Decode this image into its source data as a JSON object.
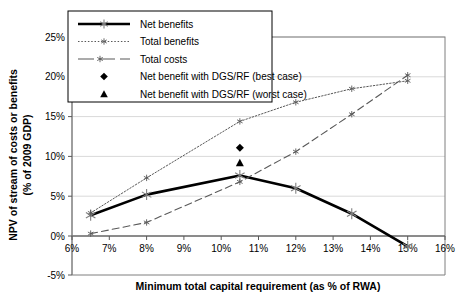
{
  "chart_data": {
    "type": "line",
    "title": "",
    "xlabel": "Minimum total capital requirement (as % of RWA)",
    "ylabel": "NPV of stream of costs or benefits (% of 2009 GDP)",
    "ylabel_line1": "NPV of stream of costs or benefits",
    "ylabel_line2": "(% of 2009 GDP)",
    "xlim": [
      6,
      16
    ],
    "ylim": [
      -5,
      25
    ],
    "xticks": [
      6,
      7,
      8,
      9,
      10,
      11,
      12,
      13,
      14,
      15,
      16
    ],
    "xtick_labels": [
      "6%",
      "7%",
      "8%",
      "9%",
      "10%",
      "11%",
      "12%",
      "13%",
      "14%",
      "15%",
      "16%"
    ],
    "yticks": [
      -5,
      0,
      5,
      10,
      15,
      20,
      25
    ],
    "ytick_labels": [
      "-5%",
      "0%",
      "5%",
      "10%",
      "15%",
      "20%",
      "25%"
    ],
    "grid": "horizontal",
    "legend_position": "top-left",
    "x": [
      6.5,
      8,
      10.5,
      12,
      13.5,
      15
    ],
    "series": [
      {
        "name": "Net benefits",
        "style": "solid-thick",
        "color": "#000000",
        "values": [
          2.6,
          5.2,
          7.6,
          6.0,
          2.8,
          -1.3
        ]
      },
      {
        "name": "Total benefits",
        "style": "dotted",
        "color": "#595959",
        "values": [
          2.9,
          7.3,
          14.4,
          16.8,
          18.5,
          19.5
        ]
      },
      {
        "name": "Total costs",
        "style": "dashed",
        "color": "#595959",
        "values": [
          0.3,
          1.7,
          6.8,
          10.6,
          15.3,
          20.2
        ]
      }
    ],
    "point_markers": [
      {
        "name": "Net benefit with DGS/RF (best case)",
        "marker": "diamond",
        "color": "#000000",
        "x": 10.5,
        "y": 11.1
      },
      {
        "name": "Net benefit with DGS/RF (worst case)",
        "marker": "triangle",
        "color": "#000000",
        "x": 10.5,
        "y": 9.2
      }
    ],
    "legend": [
      {
        "label": "Net benefits",
        "symbol": "solid-thick-line"
      },
      {
        "label": "Total benefits",
        "symbol": "dotted-line"
      },
      {
        "label": "Total costs",
        "symbol": "dashed-line"
      },
      {
        "label": "Net benefit with DGS/RF (best case)",
        "symbol": "diamond"
      },
      {
        "label": "Net benefit with DGS/RF (worst case)",
        "symbol": "triangle"
      }
    ]
  }
}
